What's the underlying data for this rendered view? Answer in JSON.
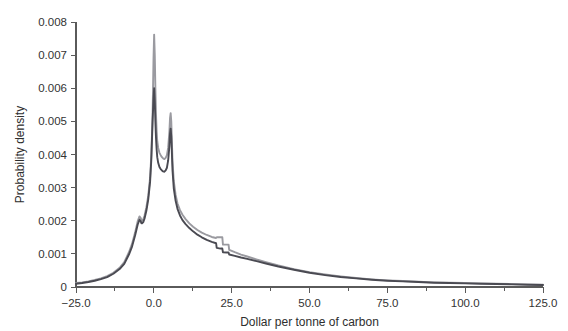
{
  "chart_data": {
    "type": "line",
    "title": "",
    "xlabel": "Dollar per tonne of carbon",
    "ylabel": "Probability density",
    "xlim": [
      -25.0,
      125.0
    ],
    "ylim": [
      0,
      0.008
    ],
    "grid": false,
    "legend": "none",
    "xticks": [
      -25.0,
      0.0,
      25.0,
      50.0,
      75.0,
      100.0,
      125.0
    ],
    "xtick_labels": [
      "−25.0",
      "0.0",
      "25.0",
      "50.0",
      "75.0",
      "100.0",
      "125.0"
    ],
    "xminor_ticks": [
      -12.5,
      12.5,
      37.5,
      62.5,
      87.5,
      112.5
    ],
    "yticks": [
      0,
      0.001,
      0.002,
      0.003,
      0.004,
      0.005,
      0.006,
      0.007,
      0.008
    ],
    "ytick_labels": [
      "0",
      "0.001",
      "0.002",
      "0.003",
      "0.004",
      "0.005",
      "0.006",
      "0.007",
      "0.008"
    ],
    "series": [
      {
        "name": "distribution-light",
        "color": "#9a9aa0",
        "x": [
          -25.0,
          -23.0,
          -21.0,
          -19.0,
          -17.0,
          -15.0,
          -13.0,
          -11.0,
          -9.5,
          -8.0,
          -7.0,
          -6.0,
          -5.2,
          -4.6,
          -4.2,
          -4.0,
          -3.8,
          -3.4,
          -3.0,
          -2.4,
          -1.8,
          -1.2,
          -0.8,
          -0.4,
          -0.1,
          0.1,
          0.3,
          0.5,
          0.7,
          0.9,
          1.1,
          1.4,
          1.8,
          2.2,
          2.6,
          3.0,
          3.4,
          3.8,
          4.2,
          4.6,
          5.0,
          5.2,
          5.4,
          5.6,
          5.8,
          6.0,
          6.4,
          7.0,
          7.6,
          8.4,
          9.2,
          10.2,
          11.4,
          12.6,
          14.0,
          15.4,
          17.0,
          18.6,
          20.0,
          20.2,
          21.4,
          22.0,
          22.2,
          23.4,
          24.0,
          24.2,
          26.0,
          28.0,
          30.0,
          33.0,
          36.0,
          40.0,
          45.0,
          50.0,
          55.0,
          60.0,
          65.0,
          70.0,
          75.0,
          80.0,
          85.0,
          90.0,
          95.0,
          100.0,
          105.0,
          110.0,
          115.0,
          120.0,
          125.0
        ],
        "y": [
          0.00012,
          0.00014,
          0.00017,
          0.00021,
          0.00026,
          0.00033,
          0.00043,
          0.00058,
          0.00075,
          0.00105,
          0.0013,
          0.00165,
          0.00198,
          0.00213,
          0.00208,
          0.00202,
          0.002,
          0.00204,
          0.00215,
          0.0024,
          0.00275,
          0.0033,
          0.004,
          0.0052,
          0.0069,
          0.00762,
          0.007,
          0.006,
          0.0052,
          0.0047,
          0.0044,
          0.0042,
          0.00405,
          0.00398,
          0.00392,
          0.00388,
          0.00386,
          0.0039,
          0.00398,
          0.0042,
          0.0047,
          0.0051,
          0.00525,
          0.005,
          0.0044,
          0.0038,
          0.0032,
          0.00278,
          0.00252,
          0.00232,
          0.00218,
          0.00205,
          0.00192,
          0.00182,
          0.00172,
          0.00164,
          0.00157,
          0.00151,
          0.00148,
          0.0015,
          0.0015,
          0.0015,
          0.00128,
          0.00128,
          0.00128,
          0.00112,
          0.00105,
          0.00098,
          0.00092,
          0.00083,
          0.00075,
          0.00065,
          0.00054,
          0.00045,
          0.00038,
          0.00032,
          0.00027,
          0.00023,
          0.0002,
          0.00018,
          0.00016,
          0.00014,
          0.00013,
          0.00012,
          0.00011,
          0.0001,
          9e-05,
          8e-05,
          7e-05
        ]
      },
      {
        "name": "distribution-dark",
        "color": "#4a4a52",
        "x": [
          -25.0,
          -23.0,
          -21.0,
          -19.0,
          -17.0,
          -15.0,
          -13.0,
          -11.0,
          -9.5,
          -8.0,
          -7.0,
          -6.0,
          -5.2,
          -4.6,
          -4.2,
          -4.0,
          -3.8,
          -3.4,
          -3.0,
          -2.4,
          -1.8,
          -1.2,
          -0.8,
          -0.4,
          -0.1,
          0.1,
          0.3,
          0.5,
          0.7,
          0.9,
          1.1,
          1.4,
          1.8,
          2.2,
          2.6,
          3.0,
          3.4,
          3.8,
          4.2,
          4.6,
          5.0,
          5.2,
          5.4,
          5.6,
          5.8,
          6.0,
          6.4,
          7.0,
          7.6,
          8.4,
          9.2,
          10.2,
          11.4,
          12.6,
          14.0,
          15.4,
          17.0,
          18.6,
          20.0,
          20.2,
          21.4,
          22.0,
          22.2,
          23.4,
          24.0,
          24.2,
          26.0,
          28.0,
          30.0,
          33.0,
          36.0,
          40.0,
          45.0,
          50.0,
          55.0,
          60.0,
          65.0,
          70.0,
          75.0,
          80.0,
          85.0,
          90.0,
          95.0,
          100.0,
          105.0,
          110.0,
          115.0,
          120.0,
          125.0
        ],
        "y": [
          0.0001,
          0.00012,
          0.00015,
          0.00019,
          0.00024,
          0.0003,
          0.0004,
          0.00054,
          0.0007,
          0.00098,
          0.00122,
          0.00156,
          0.00188,
          0.00203,
          0.00198,
          0.00193,
          0.00192,
          0.00196,
          0.00206,
          0.0023,
          0.00264,
          0.00318,
          0.00386,
          0.005,
          0.0057,
          0.006,
          0.0056,
          0.005,
          0.0045,
          0.00415,
          0.00392,
          0.00375,
          0.00362,
          0.00356,
          0.00352,
          0.00349,
          0.00348,
          0.00352,
          0.0036,
          0.00382,
          0.00425,
          0.00462,
          0.00478,
          0.00455,
          0.00405,
          0.00352,
          0.00298,
          0.0026,
          0.00236,
          0.00216,
          0.00202,
          0.0019,
          0.00178,
          0.00168,
          0.00158,
          0.0015,
          0.00142,
          0.00136,
          0.00132,
          0.00118,
          0.00116,
          0.00116,
          0.00105,
          0.00104,
          0.00104,
          0.00098,
          0.00094,
          0.00089,
          0.00085,
          0.00078,
          0.00071,
          0.00062,
          0.00052,
          0.00043,
          0.00036,
          0.0003,
          0.00026,
          0.00022,
          0.00019,
          0.00017,
          0.00015,
          0.00013,
          0.00012,
          0.00011,
          0.0001,
          9e-05,
          8e-05,
          7e-05,
          6e-05
        ]
      }
    ],
    "annotations": [
      {
        "name": "primary-peak",
        "x": 0.1,
        "y": 0.00762
      },
      {
        "name": "secondary-peak",
        "x": 5.4,
        "y": 0.00525
      },
      {
        "name": "step-discontinuity-1",
        "x": 22.1,
        "y": 0.0013
      },
      {
        "name": "step-discontinuity-2",
        "x": 24.1,
        "y": 0.00115
      }
    ]
  },
  "layout": {
    "plot_left_px": 76,
    "plot_right_px": 543,
    "plot_top_px": 22,
    "plot_bottom_px": 287
  }
}
